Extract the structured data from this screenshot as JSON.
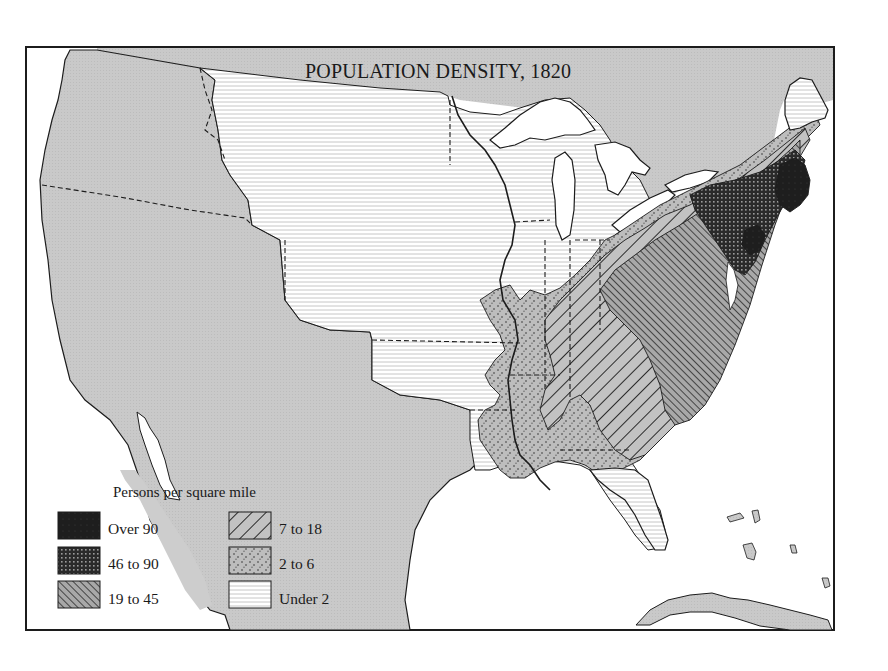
{
  "map": {
    "title": "POPULATION DENSITY, 1820",
    "colors": {
      "foreign_land": "#c9c9c9",
      "water": "#ffffff",
      "border": "#1c1c1c",
      "hatch": "#2a2a2a",
      "dark_fill": "#222222"
    }
  },
  "legend": {
    "title": "Persons per square mile",
    "items": [
      {
        "label": "Over 90",
        "pattern": "solid-dark"
      },
      {
        "label": "46 to 90",
        "pattern": "crosshatch-grid"
      },
      {
        "label": "19 to 45",
        "pattern": "dense-diagonal-right"
      },
      {
        "label": "7 to 18",
        "pattern": "wide-diagonal-left"
      },
      {
        "label": "2 to 6",
        "pattern": "stipple-dots"
      },
      {
        "label": "Under 2",
        "pattern": "horizontal-lines"
      }
    ]
  }
}
